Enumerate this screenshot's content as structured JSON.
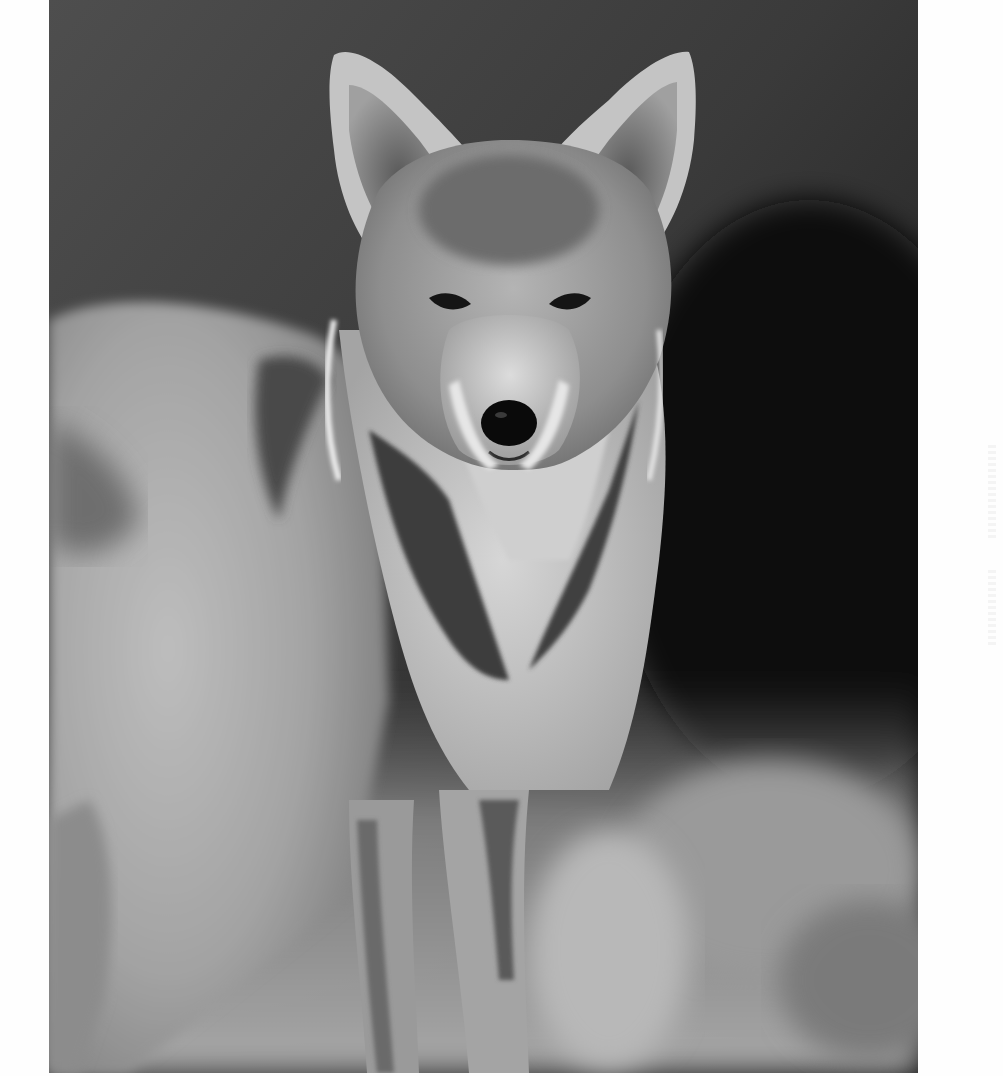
{
  "image": {
    "subject": "coyote",
    "style": "black-and-white photograph",
    "description": "Front-facing coyote with large upright ears, standing in front of a dark blurred background with pale blurred vegetation at the bottom",
    "colors": {
      "page_background": "#ffffff",
      "background_dark": "#1a1a1a",
      "background_mid": "#4a4a4a",
      "fur_light": "#d8d8d8",
      "fur_mid": "#9a9a9a",
      "fur_dark": "#3c3c3c",
      "nose": "#0a0a0a"
    }
  }
}
